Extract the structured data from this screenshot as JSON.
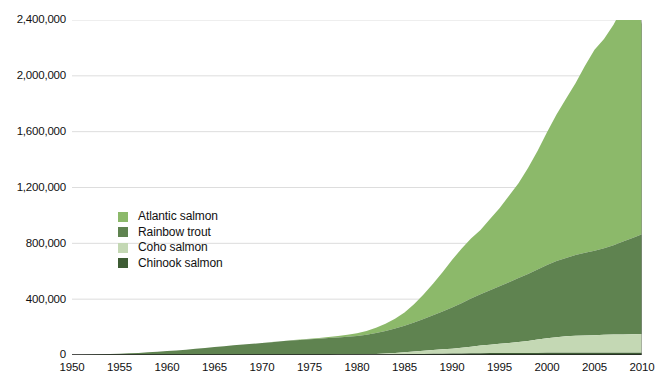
{
  "chart_data": {
    "type": "area",
    "stacked": true,
    "title": "",
    "subtitle": "",
    "xlabel": "",
    "ylabel": "",
    "xlim": [
      1950,
      2010
    ],
    "ylim": [
      0,
      2400000
    ],
    "grid": true,
    "legend_position": "inside-left",
    "x_tick_labels": [
      "1950",
      "1955",
      "1960",
      "1965",
      "1970",
      "1975",
      "1980",
      "1985",
      "1990",
      "1995",
      "2000",
      "2005",
      "2010"
    ],
    "x_ticks": [
      1950,
      1955,
      1960,
      1965,
      1970,
      1975,
      1980,
      1985,
      1990,
      1995,
      2000,
      2005,
      2010
    ],
    "y_tick_labels": [
      "0",
      "400,000",
      "800,000",
      "1,200,000",
      "1,600,000",
      "2,000,000",
      "2,400,000"
    ],
    "y_ticks": [
      0,
      400000,
      800000,
      1200000,
      1600000,
      2000000,
      2400000
    ],
    "x": [
      1950,
      1951,
      1952,
      1953,
      1954,
      1955,
      1956,
      1957,
      1958,
      1959,
      1960,
      1961,
      1962,
      1963,
      1964,
      1965,
      1966,
      1967,
      1968,
      1969,
      1970,
      1971,
      1972,
      1973,
      1974,
      1975,
      1976,
      1977,
      1978,
      1979,
      1980,
      1981,
      1982,
      1983,
      1984,
      1985,
      1986,
      1987,
      1988,
      1989,
      1990,
      1991,
      1992,
      1993,
      1994,
      1995,
      1996,
      1997,
      1998,
      1999,
      2000,
      2001,
      2002,
      2003,
      2004,
      2005,
      2006,
      2007,
      2008,
      2009,
      2010
    ],
    "series": [
      {
        "name": "Chinook salmon",
        "color": "#3e5c34",
        "stack_order": 1,
        "values": [
          0,
          0,
          0,
          0,
          0,
          0,
          0,
          0,
          0,
          0,
          0,
          0,
          0,
          0,
          0,
          0,
          0,
          0,
          0,
          0,
          0,
          0,
          0,
          0,
          0,
          0,
          0,
          100,
          300,
          600,
          1000,
          1500,
          2200,
          3000,
          4000,
          5200,
          6500,
          7500,
          8500,
          9500,
          10500,
          11500,
          12500,
          13200,
          13800,
          14200,
          14500,
          14800,
          15000,
          15200,
          15400,
          15600,
          15800,
          16000,
          16100,
          16200,
          16300,
          16400,
          16500,
          16600,
          16700
        ]
      },
      {
        "name": "Coho salmon",
        "color": "#c4d8b4",
        "stack_order": 2,
        "values": [
          0,
          0,
          0,
          0,
          0,
          0,
          0,
          0,
          0,
          0,
          0,
          0,
          0,
          0,
          0,
          0,
          0,
          0,
          0,
          0,
          0,
          0,
          0,
          0,
          0,
          0,
          100,
          300,
          700,
          1200,
          2000,
          3200,
          5000,
          7500,
          11000,
          15000,
          19000,
          23000,
          27000,
          31000,
          35000,
          40000,
          47000,
          54000,
          60000,
          66000,
          72000,
          78000,
          85000,
          95000,
          105000,
          112000,
          118000,
          122000,
          124000,
          126000,
          128000,
          130000,
          131000,
          132000,
          133000
        ]
      },
      {
        "name": "Rainbow trout",
        "color": "#5f8350",
        "stack_order": 3,
        "values": [
          1000,
          2000,
          3500,
          5000,
          7000,
          9000,
          12000,
          15000,
          19000,
          23000,
          28000,
          33000,
          38000,
          44000,
          50000,
          57000,
          63000,
          69000,
          75000,
          80000,
          86000,
          92000,
          98000,
          103000,
          108000,
          113000,
          117000,
          121000,
          125000,
          129000,
          133000,
          140000,
          150000,
          162000,
          175000,
          190000,
          208000,
          228000,
          250000,
          272000,
          295000,
          320000,
          345000,
          368000,
          390000,
          412000,
          435000,
          458000,
          480000,
          502000,
          525000,
          545000,
          562000,
          578000,
          592000,
          605000,
          620000,
          640000,
          665000,
          690000,
          715000
        ]
      },
      {
        "name": "Atlantic salmon",
        "color": "#8cb96a",
        "stack_order": 4,
        "values": [
          0,
          0,
          0,
          0,
          0,
          0,
          0,
          0,
          0,
          0,
          0,
          0,
          0,
          0,
          0,
          0,
          0,
          0,
          0,
          0,
          500,
          800,
          1200,
          1800,
          2600,
          3600,
          5000,
          7000,
          10000,
          14000,
          19000,
          27000,
          38000,
          52000,
          70000,
          95000,
          130000,
          175000,
          225000,
          280000,
          340000,
          390000,
          430000,
          460000,
          510000,
          560000,
          620000,
          680000,
          760000,
          850000,
          950000,
          1050000,
          1140000,
          1230000,
          1340000,
          1440000,
          1500000,
          1580000,
          1680000,
          1790000,
          1505000
        ]
      }
    ],
    "totals_note": "Stacked total peaks at approximately 2,370,000 in 2009",
    "peak_total": 2370000,
    "peak_year": 2009
  },
  "legend": {
    "items": [
      {
        "label": "Atlantic salmon",
        "color": "#8cb96a"
      },
      {
        "label": "Rainbow trout",
        "color": "#5f8350"
      },
      {
        "label": "Coho salmon",
        "color": "#c4d8b4"
      },
      {
        "label": "Chinook salmon",
        "color": "#3e5c34"
      }
    ]
  },
  "axes": {
    "y_labels": [
      "2,400,000",
      "2,000,000",
      "1,600,000",
      "1,200,000",
      "800,000",
      "400,000",
      "0"
    ],
    "x_labels": [
      "1950",
      "1955",
      "1960",
      "1965",
      "1970",
      "1975",
      "1980",
      "1985",
      "1990",
      "1995",
      "2000",
      "2005",
      "2010"
    ]
  },
  "style": {
    "grid_color": "#dddddd",
    "axis_color": "#222222",
    "text_color": "#111111",
    "background": "#ffffff"
  }
}
